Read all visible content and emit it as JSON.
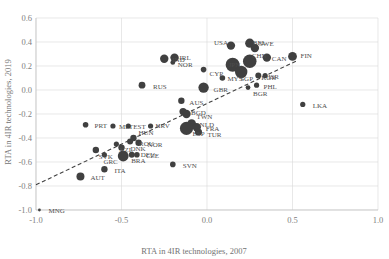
{
  "chart_data": {
    "type": "scatter",
    "title": "",
    "xlabel": "RTA in 4IR technologies, 2007",
    "ylabel": "RTA in 4IR technologies, 2019",
    "xlim": [
      -1.0,
      1.0
    ],
    "ylim": [
      -1.0,
      0.6
    ],
    "xticks": [
      "-1.0",
      "-0.5",
      "0.0",
      "0.5",
      "1.0"
    ],
    "xtick_values": [
      -1.0,
      -0.5,
      0.0,
      0.5,
      1.0
    ],
    "yticks": [
      "0.6",
      "0.4",
      "0.2",
      "0.0",
      "-0.2",
      "-0.4",
      "-0.6",
      "-0.8",
      "-1.0"
    ],
    "ytick_values": [
      0.6,
      0.4,
      0.2,
      0.0,
      -0.2,
      -0.4,
      -0.6,
      -0.8,
      -1.0
    ],
    "grid": "vertical-and-horizontal-light",
    "legend": "none",
    "marker_color": "#404040",
    "trendline": {
      "style": "dashed",
      "color": "#404040",
      "x0": -1.0,
      "y0": -0.79,
      "x1": 0.52,
      "y1": 0.24
    },
    "points": [
      {
        "label": "MNG",
        "x": -0.98,
        "y": -1.0,
        "size": 1.4,
        "lx": 9,
        "ly": 3
      },
      {
        "label": "AUT",
        "x": -0.74,
        "y": -0.72,
        "size": 4.0,
        "lx": 10,
        "ly": 4
      },
      {
        "label": "ITA",
        "x": -0.6,
        "y": -0.66,
        "size": 3.2,
        "lx": 10,
        "ly": 4
      },
      {
        "label": "SVK",
        "x": -0.65,
        "y": -0.5,
        "size": 3.2,
        "lx": 3,
        "ly": 9
      },
      {
        "label": "BRA",
        "x": -0.49,
        "y": -0.55,
        "size": 5.4,
        "lx": 8,
        "ly": 7
      },
      {
        "label": "DNK",
        "x": -0.5,
        "y": -0.48,
        "size": 3.2,
        "lx": 9,
        "ly": 3
      },
      {
        "label": "DEU",
        "x": -0.44,
        "y": -0.54,
        "size": 3.0,
        "lx": 9,
        "ly": 2
      },
      {
        "label": "CZE",
        "x": -0.41,
        "y": -0.54,
        "size": 2.8,
        "lx": 9,
        "ly": 3
      },
      {
        "label": "GRC",
        "x": -0.6,
        "y": -0.54,
        "size": 2.6,
        "lx": -1,
        "ly": 9
      },
      {
        "label": "NZL",
        "x": -0.53,
        "y": -0.45,
        "size": 2.6,
        "lx": 3,
        "ly": 8
      },
      {
        "label": "ROU",
        "x": -0.45,
        "y": -0.43,
        "size": 3.0,
        "lx": 9,
        "ly": 4
      },
      {
        "label": "NOR",
        "x": -0.4,
        "y": -0.44,
        "size": 3.2,
        "lx": 9,
        "ly": 4
      },
      {
        "label": "HUN",
        "x": -0.43,
        "y": -0.4,
        "size": 3.2,
        "lx": 5,
        "ly": -3
      },
      {
        "label": "PRT",
        "x": -0.71,
        "y": -0.29,
        "size": 2.8,
        "lx": 9,
        "ly": 3
      },
      {
        "label": "MLT",
        "x": -0.55,
        "y": -0.3,
        "size": 2.6,
        "lx": 6,
        "ly": 3
      },
      {
        "label": "EST",
        "x": -0.46,
        "y": -0.3,
        "size": 2.6,
        "lx": 5,
        "ly": 3
      },
      {
        "label": "HRV",
        "x": -0.33,
        "y": -0.3,
        "size": 2.6,
        "lx": 5,
        "ly": 2
      },
      {
        "label": "SVN",
        "x": -0.2,
        "y": -0.62,
        "size": 2.8,
        "lx": 10,
        "ly": 4
      },
      {
        "label": "AUS",
        "x": -0.15,
        "y": -0.09,
        "size": 3.2,
        "lx": 8,
        "ly": 4
      },
      {
        "label": "RUS",
        "x": -0.38,
        "y": 0.04,
        "size": 3.4,
        "lx": 11,
        "ly": 4
      },
      {
        "label": "BGD",
        "x": -0.14,
        "y": -0.18,
        "size": 3.6,
        "lx": 8,
        "ly": 3
      },
      {
        "label": "TWN",
        "x": -0.12,
        "y": -0.2,
        "size": 4.2,
        "lx": 10,
        "ly": 5
      },
      {
        "label": "NLD",
        "x": -0.09,
        "y": -0.28,
        "size": 4.4,
        "lx": 8,
        "ly": 3
      },
      {
        "label": "FRA",
        "x": -0.06,
        "y": -0.31,
        "size": 4.2,
        "lx": 9,
        "ly": 4
      },
      {
        "label": "TUR",
        "x": -0.05,
        "y": -0.35,
        "size": 3.6,
        "lx": 9,
        "ly": 5
      },
      {
        "label": "ESP",
        "x": -0.12,
        "y": -0.32,
        "size": 6.6,
        "lx": 6,
        "ly": 8
      },
      {
        "label": "GBR",
        "x": -0.02,
        "y": 0.02,
        "size": 5.2,
        "lx": 10,
        "ly": 4
      },
      {
        "label": "CYP",
        "x": -0.02,
        "y": 0.17,
        "size": 2.8,
        "lx": 6,
        "ly": 6
      },
      {
        "label": "IND",
        "x": -0.25,
        "y": 0.26,
        "size": 4.2,
        "lx": 8,
        "ly": 3
      },
      {
        "label": "IRL",
        "x": -0.19,
        "y": 0.27,
        "size": 4.2,
        "lx": 5,
        "ly": 2
      },
      {
        "label": "NOR2",
        "x": -0.2,
        "y": 0.23,
        "size": 2.4,
        "lx": 5,
        "ly": 5
      },
      {
        "label": "USA",
        "x": 0.14,
        "y": 0.37,
        "size": 4.2,
        "lx": -17,
        "ly": -1
      },
      {
        "label": "BEL",
        "x": 0.25,
        "y": 0.39,
        "size": 4.6,
        "lx": 3,
        "ly": 2
      },
      {
        "label": "SWE",
        "x": 0.28,
        "y": 0.35,
        "size": 4.2,
        "lx": 4,
        "ly": -2
      },
      {
        "label": "CHN",
        "x": 0.25,
        "y": 0.24,
        "size": 6.8,
        "lx": 2,
        "ly": -3
      },
      {
        "label": "JPN",
        "x": 0.15,
        "y": 0.21,
        "size": 7.0,
        "lx": -4,
        "ly": 2
      },
      {
        "label": "CAN",
        "x": 0.35,
        "y": 0.27,
        "size": 4.2,
        "lx": 5,
        "ly": 3
      },
      {
        "label": "FIN",
        "x": 0.5,
        "y": 0.28,
        "size": 4.4,
        "lx": 8,
        "ly": 2
      },
      {
        "label": "SGP",
        "x": 0.2,
        "y": 0.15,
        "size": 6.2,
        "lx": -1,
        "ly": 9
      },
      {
        "label": "KOR",
        "x": 0.3,
        "y": 0.12,
        "size": 3.0,
        "lx": 3,
        "ly": 4
      },
      {
        "label": "ISR",
        "x": 0.34,
        "y": 0.12,
        "size": 2.6,
        "lx": 3,
        "ly": 3
      },
      {
        "label": "MYS",
        "x": 0.09,
        "y": 0.1,
        "size": 2.8,
        "lx": 5,
        "ly": 3
      },
      {
        "label": "PHL",
        "x": 0.29,
        "y": 0.04,
        "size": 2.6,
        "lx": 7,
        "ly": 4
      },
      {
        "label": "BGR",
        "x": 0.24,
        "y": 0.02,
        "size": 2.4,
        "lx": 5,
        "ly": 8
      },
      {
        "label": "LKA",
        "x": 0.56,
        "y": -0.12,
        "size": 2.6,
        "lx": 10,
        "ly": 4
      }
    ]
  }
}
